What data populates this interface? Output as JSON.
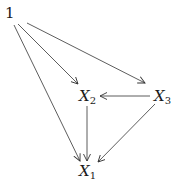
{
  "diagram": {
    "type": "directed-graph",
    "nodes": [
      {
        "id": "one",
        "label": "1",
        "var": "",
        "sub": ""
      },
      {
        "id": "x2",
        "label": "X2",
        "var": "X",
        "sub": "2"
      },
      {
        "id": "x3",
        "label": "X3",
        "var": "X",
        "sub": "3"
      },
      {
        "id": "x1",
        "label": "X1",
        "var": "X",
        "sub": "1"
      }
    ],
    "edges": [
      {
        "from": "one",
        "to": "x2"
      },
      {
        "from": "one",
        "to": "x3"
      },
      {
        "from": "one",
        "to": "x1"
      },
      {
        "from": "x3",
        "to": "x2"
      },
      {
        "from": "x2",
        "to": "x1"
      },
      {
        "from": "x3",
        "to": "x1"
      }
    ],
    "colors": {
      "line": "#333333",
      "text": "#1a1a1a",
      "background": "#ffffff"
    }
  }
}
